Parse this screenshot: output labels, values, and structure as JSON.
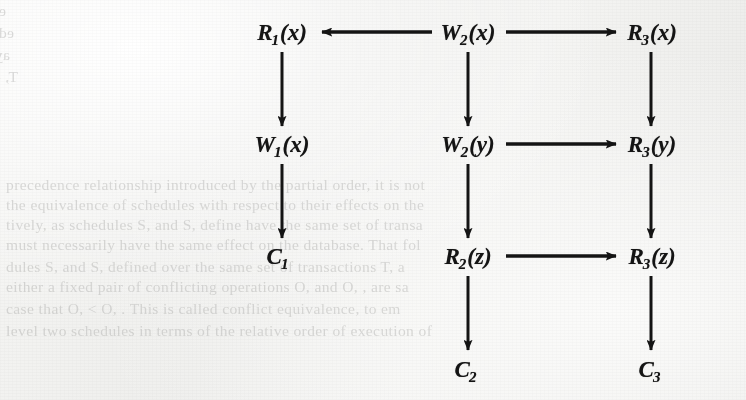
{
  "figure": {
    "kind": "precedence-graph",
    "background_note": "scanned book page with faint mirrored show-through text",
    "ink_color": "#141414",
    "paper_color": "#f2f2f0"
  },
  "nodes": [
    {
      "id": "n_r1x",
      "base": "R",
      "sub": "1",
      "arg": "(x)",
      "label": "R1(x)",
      "col": 0,
      "row": 0,
      "x": 282,
      "y": 33
    },
    {
      "id": "n_w2x",
      "base": "W",
      "sub": "2",
      "arg": "(x)",
      "label": "W2(x)",
      "col": 1,
      "row": 0,
      "x": 468,
      "y": 33
    },
    {
      "id": "n_r3x",
      "base": "R",
      "sub": "3",
      "arg": "(x)",
      "label": "R3(x)",
      "col": 2,
      "row": 0,
      "x": 652,
      "y": 33
    },
    {
      "id": "n_w1x",
      "base": "W",
      "sub": "1",
      "arg": "(x)",
      "label": "W1(x)",
      "col": 0,
      "row": 1,
      "x": 282,
      "y": 145
    },
    {
      "id": "n_w2y",
      "base": "W",
      "sub": "2",
      "arg": "(y)",
      "label": "W2(y)",
      "col": 1,
      "row": 1,
      "x": 468,
      "y": 145
    },
    {
      "id": "n_r3y",
      "base": "R",
      "sub": "3",
      "arg": "(y)",
      "label": "R3(y)",
      "col": 2,
      "row": 1,
      "x": 652,
      "y": 145
    },
    {
      "id": "n_c1",
      "base": "C",
      "sub": "1",
      "arg": "",
      "label": "C1",
      "col": 0,
      "row": 2,
      "x": 278,
      "y": 257
    },
    {
      "id": "n_r2z",
      "base": "R",
      "sub": "2",
      "arg": "(z)",
      "label": "R2(z)",
      "col": 1,
      "row": 2,
      "x": 468,
      "y": 257
    },
    {
      "id": "n_r3z",
      "base": "R",
      "sub": "3",
      "arg": "(z)",
      "label": "R3(z)",
      "col": 2,
      "row": 2,
      "x": 652,
      "y": 257
    },
    {
      "id": "n_c2",
      "base": "C",
      "sub": "2",
      "arg": "",
      "label": "C2",
      "col": 1,
      "row": 3,
      "x": 466,
      "y": 370
    },
    {
      "id": "n_c3",
      "base": "C",
      "sub": "3",
      "arg": "",
      "label": "C3",
      "col": 2,
      "row": 3,
      "x": 650,
      "y": 370
    }
  ],
  "edges": [
    {
      "id": "e_w2x_r1x",
      "from": "n_w2x",
      "to": "n_r1x",
      "dir": "left",
      "x1": 432,
      "y1": 32,
      "x2": 322,
      "y2": 32
    },
    {
      "id": "e_w2x_r3x",
      "from": "n_w2x",
      "to": "n_r3x",
      "dir": "right",
      "x1": 506,
      "y1": 32,
      "x2": 616,
      "y2": 32
    },
    {
      "id": "e_r1x_w1x",
      "from": "n_r1x",
      "to": "n_w1x",
      "dir": "down",
      "x1": 282,
      "y1": 52,
      "x2": 282,
      "y2": 126
    },
    {
      "id": "e_w2x_w2y",
      "from": "n_w2x",
      "to": "n_w2y",
      "dir": "down",
      "x1": 468,
      "y1": 52,
      "x2": 468,
      "y2": 126
    },
    {
      "id": "e_r3x_r3y",
      "from": "n_r3x",
      "to": "n_r3y",
      "dir": "down",
      "x1": 651,
      "y1": 52,
      "x2": 651,
      "y2": 126
    },
    {
      "id": "e_w2y_r3y",
      "from": "n_w2y",
      "to": "n_r3y",
      "dir": "right",
      "x1": 506,
      "y1": 144,
      "x2": 616,
      "y2": 144
    },
    {
      "id": "e_w1x_c1",
      "from": "n_w1x",
      "to": "n_c1",
      "dir": "down",
      "x1": 282,
      "y1": 164,
      "x2": 282,
      "y2": 238
    },
    {
      "id": "e_w2y_r2z",
      "from": "n_w2y",
      "to": "n_r2z",
      "dir": "down",
      "x1": 468,
      "y1": 164,
      "x2": 468,
      "y2": 238
    },
    {
      "id": "e_r3y_r3z",
      "from": "n_r3y",
      "to": "n_r3z",
      "dir": "down",
      "x1": 651,
      "y1": 164,
      "x2": 651,
      "y2": 238
    },
    {
      "id": "e_r2z_r3z",
      "from": "n_r2z",
      "to": "n_r3z",
      "dir": "right",
      "x1": 506,
      "y1": 256,
      "x2": 616,
      "y2": 256
    },
    {
      "id": "e_r2z_c2",
      "from": "n_r2z",
      "to": "n_c2",
      "dir": "down",
      "x1": 468,
      "y1": 276,
      "x2": 468,
      "y2": 350
    },
    {
      "id": "e_r3z_c3",
      "from": "n_r3z",
      "to": "n_c3",
      "dir": "down",
      "x1": 651,
      "y1": 276,
      "x2": 651,
      "y2": 350
    }
  ],
  "ghost_text": {
    "note": "faint mirrored bleed-through of text printed on the other side of the page",
    "lines": [
      {
        "text": "es all the operations of T, are executed before all the operations",
        "x": 6,
        "y": 2,
        "mirrored": true
      },
      {
        "text": "ed us that T, cannot be such an operations of T,. One",
        "x": 14,
        "y": 24,
        "mirrored": true
      },
      {
        "text": "ay to depict this precedence relationship is as well as that, for ex",
        "x": 10,
        "y": 46,
        "mirrored": true
      },
      {
        "text": "T, - T, or S, or S, read - - T,",
        "x": 18,
        "y": 68,
        "mirrored": true
      },
      {
        "text": "precedence relationship introduced by the partial order, it is not",
        "x": 6,
        "y": 176,
        "mirrored": false
      },
      {
        "text": "the equivalence of schedules with respect to their effects on the",
        "x": 6,
        "y": 196,
        "mirrored": false
      },
      {
        "text": "tively, as schedules S, and S, define have the same set of transa",
        "x": 6,
        "y": 216,
        "mirrored": false
      },
      {
        "text": "must necessarily have the same effect on the database. That fol",
        "x": 6,
        "y": 236,
        "mirrored": false
      },
      {
        "text": "dules  S, and S, defined over the same set of transactions T, a",
        "x": 6,
        "y": 258,
        "mirrored": false
      },
      {
        "text": "either a fixed pair of conflicting operations O, and O, , are sa",
        "x": 6,
        "y": 278,
        "mirrored": false
      },
      {
        "text": "case that O, <  O, . This is called conflict equivalence, to em",
        "x": 6,
        "y": 300,
        "mirrored": false
      },
      {
        "text": "level two schedules in terms of the relative order of execution of",
        "x": 6,
        "y": 322,
        "mirrored": false
      }
    ]
  }
}
